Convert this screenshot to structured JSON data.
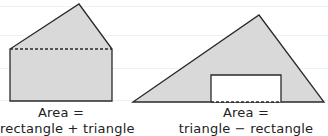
{
  "figures": [
    {
      "id": "composite-left",
      "shape": "pentagon (rectangle topped by triangle)",
      "caption_line1": "Area =",
      "caption_line2": "rectangle + triangle"
    },
    {
      "id": "composite-right",
      "shape": "triangle with rectangular cut-out",
      "caption_line1": "Area =",
      "caption_line2": "triangle − rectangle"
    }
  ],
  "colors": {
    "fill": "#d9d9d9",
    "stroke": "#2a2a2a",
    "hole": "#ffffff",
    "ruling": "#eef0f2"
  }
}
